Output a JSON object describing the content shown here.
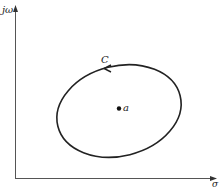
{
  "diagram": {
    "type": "complex-plane-contour",
    "axes": {
      "vertical_label": "jω",
      "horizontal_label": "σ"
    },
    "contour": {
      "label": "C",
      "shape": "closed-ellipse",
      "direction": "counterclockwise"
    },
    "point": {
      "label": "a",
      "position": "inside contour"
    },
    "colors": {
      "stroke": "#222222",
      "axis": "#555555",
      "background": "#ffffff"
    }
  }
}
